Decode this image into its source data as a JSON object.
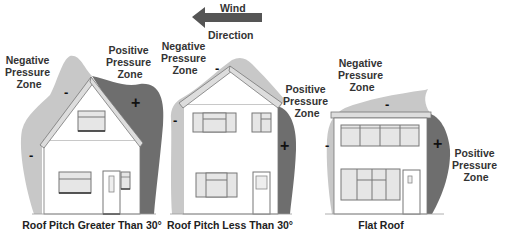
{
  "wind": {
    "line1": "Wind",
    "line2": "Direction",
    "arrow_direction": "left",
    "arrow_color": "#555555"
  },
  "colors": {
    "negative_zone": "#c8c8c8",
    "positive_zone": "#6e6e6e",
    "outline": "#555555",
    "wall": "#ffffff",
    "window_fill": "#e6e6e6"
  },
  "houses": [
    {
      "caption": "Roof Pitch Greater Than 30°",
      "negative_label": [
        "Negative",
        "Pressure",
        "Zone"
      ],
      "positive_label": [
        "Positive",
        "Pressure",
        "Zone"
      ],
      "negative_signs": [
        "-",
        "-"
      ],
      "positive_signs": [
        "+"
      ]
    },
    {
      "caption": "Roof Pitch Less Than 30°",
      "negative_label": [
        "Negative",
        "Pressure",
        "Zone"
      ],
      "positive_label": [
        "Positive",
        "Pressure",
        "Zone"
      ],
      "negative_signs": [
        "-",
        "-"
      ],
      "positive_signs": [
        "+"
      ]
    },
    {
      "caption": "Flat Roof",
      "negative_label": [
        "Negative",
        "Pressure",
        "Zone"
      ],
      "positive_label": [
        "Positive",
        "Pressure",
        "Zone"
      ],
      "negative_signs": [
        "-",
        "-"
      ],
      "positive_signs": [
        "+"
      ]
    }
  ]
}
